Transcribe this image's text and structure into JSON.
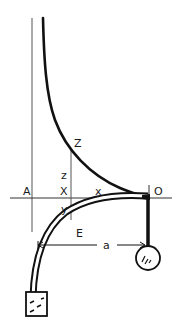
{
  "diagram": {
    "type": "physics-sketch",
    "labels": {
      "A": "A",
      "X": "X",
      "x": "x",
      "O": "O",
      "Z": "Z",
      "z": "z",
      "y": "y",
      "E": "E",
      "a": "a"
    },
    "colors": {
      "ink": "#1a1a1a",
      "thin_line": "#444444",
      "background": "#ffffff"
    }
  }
}
